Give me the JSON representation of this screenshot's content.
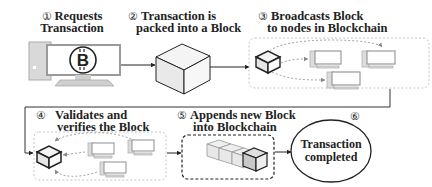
{
  "diagram": {
    "steps": [
      {
        "number": "1",
        "line1": "Requests",
        "line2": "Transaction",
        "icon": "bitcoin-computer-icon"
      },
      {
        "number": "2",
        "line1": "Transaction is",
        "line2": "packed into a Block",
        "icon": "block-cube-icon"
      },
      {
        "number": "3",
        "line1": "Broadcasts Block",
        "line2": "to nodes in Blockchain",
        "icon": "broadcast-network-icon"
      },
      {
        "number": "4",
        "line1": "Validates and",
        "line2": "verifies the Block",
        "icon": "validation-network-icon"
      },
      {
        "number": "5",
        "line1": "Appends new Block",
        "line2": "into Blockchain",
        "icon": "blockchain-chain-icon"
      },
      {
        "number": "6",
        "line1": "Transaction",
        "line2": "completed",
        "icon": "completed-ellipse"
      }
    ],
    "circled_numbers": [
      "①",
      "②",
      "③",
      "④",
      "⑤",
      "⑥"
    ],
    "colors": {
      "stroke": "#222222",
      "cube_fill": "#f2f2f2",
      "dashed_box": "#bdbdbd",
      "computer_fill": "#e0e0e0",
      "chain_fill": "#e6e6e6"
    }
  }
}
